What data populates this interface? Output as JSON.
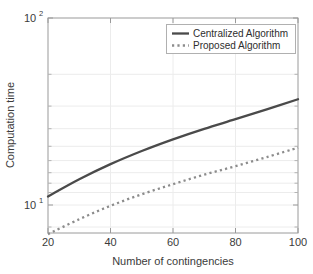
{
  "chart_data": {
    "type": "line",
    "title": "",
    "xlabel": "Number of contingencies",
    "ylabel": "Computation time",
    "xlim": [
      20,
      100
    ],
    "ylim": [
      7.0,
      100
    ],
    "yscale": "log",
    "xscale": "linear",
    "grid": true,
    "legend_position": "top-right",
    "xticks": [
      20,
      40,
      60,
      80,
      100
    ],
    "xticklabels": [
      "20",
      "40",
      "60",
      "80",
      "100"
    ],
    "yticks": [
      10,
      100
    ],
    "yticklabels": [
      "10",
      "100"
    ],
    "ytick_bases": [
      "10",
      "10"
    ],
    "ytick_exponents": [
      "1",
      "2"
    ],
    "x": [
      20,
      30,
      40,
      50,
      60,
      70,
      80,
      90,
      100
    ],
    "series": [
      {
        "name": "Centralized Algorithm",
        "style": "solid",
        "color": "#4a4a4a",
        "values": [
          11.0,
          13.6,
          16.4,
          19.3,
          22.3,
          25.4,
          28.6,
          32.3,
          36.6
        ]
      },
      {
        "name": "Proposed Algorithm",
        "style": "dotted",
        "color": "#8c8c8c",
        "values": [
          6.9,
          8.3,
          9.8,
          11.3,
          12.8,
          14.4,
          16.0,
          17.9,
          20.1
        ]
      }
    ]
  },
  "legend": {
    "entries": [
      {
        "label": "Centralized Algorithm"
      },
      {
        "label": "Proposed Algorithm"
      }
    ]
  },
  "axes": {
    "x_title": "Number of contingencies",
    "y_title": "Computation time",
    "x_labels": [
      "20",
      "40",
      "60",
      "80",
      "100"
    ],
    "y_label_top_base": "10",
    "y_label_top_exp": "2",
    "y_label_bottom_base": "10",
    "y_label_bottom_exp": "1"
  },
  "colors": {
    "centralized": "#4a4a4a",
    "proposed": "#8c8c8c",
    "axis": "#9a9a9a",
    "grid": "#ececec",
    "background": "#ffffff"
  }
}
